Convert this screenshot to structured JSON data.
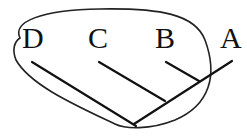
{
  "diagram": {
    "type": "cladogram",
    "taxa": [
      {
        "id": "D",
        "label": "D"
      },
      {
        "id": "C",
        "label": "C"
      },
      {
        "id": "B",
        "label": "B"
      },
      {
        "id": "A",
        "label": "A"
      }
    ],
    "grouping": {
      "description": "Closed outline encircling taxa D, C, B and their common ancestor",
      "members": [
        "D",
        "C",
        "B"
      ]
    },
    "colors": {
      "stroke": "#111111",
      "background": "#ffffff"
    }
  }
}
